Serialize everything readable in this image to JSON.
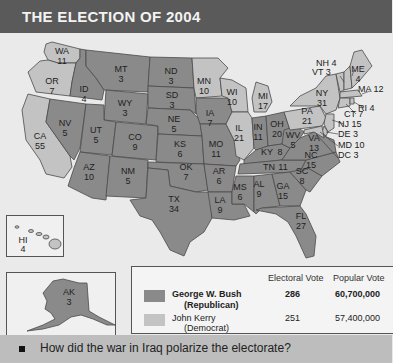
{
  "header": {
    "title": "THE ELECTION OF 2004"
  },
  "colors": {
    "republican": "#8a8a8a",
    "democrat": "#c3c3c3",
    "header_bg": "#5a5a5a",
    "footer_bg": "#bdbdbd"
  },
  "states": {
    "WA": {
      "abbr": "WA",
      "ev": "11",
      "party": "D"
    },
    "OR": {
      "abbr": "OR",
      "ev": "7",
      "party": "D"
    },
    "CA": {
      "abbr": "CA",
      "ev": "55",
      "party": "D"
    },
    "ID": {
      "abbr": "ID",
      "ev": "4",
      "party": "R"
    },
    "NV": {
      "abbr": "NV",
      "ev": "5",
      "party": "R"
    },
    "MT": {
      "abbr": "MT",
      "ev": "3",
      "party": "R"
    },
    "WY": {
      "abbr": "WY",
      "ev": "3",
      "party": "R"
    },
    "UT": {
      "abbr": "UT",
      "ev": "5",
      "party": "R"
    },
    "CO": {
      "abbr": "CO",
      "ev": "9",
      "party": "R"
    },
    "AZ": {
      "abbr": "AZ",
      "ev": "10",
      "party": "R"
    },
    "NM": {
      "abbr": "NM",
      "ev": "5",
      "party": "R"
    },
    "ND": {
      "abbr": "ND",
      "ev": "3",
      "party": "R"
    },
    "SD": {
      "abbr": "SD",
      "ev": "3",
      "party": "R"
    },
    "NE": {
      "abbr": "NE",
      "ev": "5",
      "party": "R"
    },
    "KS": {
      "abbr": "KS",
      "ev": "6",
      "party": "R"
    },
    "OK": {
      "abbr": "OK",
      "ev": "7",
      "party": "R"
    },
    "TX": {
      "abbr": "TX",
      "ev": "34",
      "party": "R"
    },
    "MN": {
      "abbr": "MN",
      "ev": "10",
      "party": "D"
    },
    "IA": {
      "abbr": "IA",
      "ev": "7",
      "party": "R"
    },
    "MO": {
      "abbr": "MO",
      "ev": "11",
      "party": "R"
    },
    "AR": {
      "abbr": "AR",
      "ev": "6",
      "party": "R"
    },
    "LA": {
      "abbr": "LA",
      "ev": "9",
      "party": "R"
    },
    "WI": {
      "abbr": "WI",
      "ev": "10",
      "party": "D"
    },
    "IL": {
      "abbr": "IL",
      "ev": "21",
      "party": "D"
    },
    "MI": {
      "abbr": "MI",
      "ev": "17",
      "party": "D"
    },
    "IN": {
      "abbr": "IN",
      "ev": "11",
      "party": "R"
    },
    "OH": {
      "abbr": "OH",
      "ev": "20",
      "party": "R"
    },
    "KY": {
      "abbr": "KY",
      "ev": "8",
      "party": "R"
    },
    "TN": {
      "abbr": "TN",
      "ev": "11",
      "party": "R"
    },
    "MS": {
      "abbr": "MS",
      "ev": "6",
      "party": "R"
    },
    "AL": {
      "abbr": "AL",
      "ev": "9",
      "party": "R"
    },
    "GA": {
      "abbr": "GA",
      "ev": "15",
      "party": "R"
    },
    "FL": {
      "abbr": "FL",
      "ev": "27",
      "party": "R"
    },
    "SC": {
      "abbr": "SC",
      "ev": "8",
      "party": "R"
    },
    "NC": {
      "abbr": "NC",
      "ev": "15",
      "party": "R"
    },
    "VA": {
      "abbr": "VA",
      "ev": "13",
      "party": "R"
    },
    "WV": {
      "abbr": "WV",
      "ev": "5",
      "party": "R"
    },
    "PA": {
      "abbr": "PA",
      "ev": "21",
      "party": "D"
    },
    "NY": {
      "abbr": "NY",
      "ev": "31",
      "party": "D"
    },
    "NH": {
      "label": "NH 4",
      "party": "D"
    },
    "VT": {
      "label": "VT 3",
      "party": "D"
    },
    "ME": {
      "abbr": "ME",
      "ev": "4",
      "party": "D"
    },
    "MA": {
      "label": "MA 12",
      "party": "D"
    },
    "RI": {
      "label": "RI 4",
      "party": "D"
    },
    "CT": {
      "label": "CT 7",
      "party": "D"
    },
    "NJ": {
      "label": "NJ 15",
      "party": "D"
    },
    "DE": {
      "label": "DE 3",
      "party": "D"
    },
    "MD": {
      "label": "MD 10",
      "party": "D"
    },
    "DC": {
      "label": "DC 3",
      "party": "D"
    },
    "HI": {
      "abbr": "HI",
      "ev": "4",
      "party": "D"
    },
    "AK": {
      "abbr": "AK",
      "ev": "3",
      "party": "R"
    }
  },
  "legend": {
    "col_electoral": "Electoral Vote",
    "col_popular": "Popular Vote",
    "candidates": [
      {
        "name": "George W. Bush",
        "party": "(Republican)",
        "electoral": "286",
        "popular": "60,700,000"
      },
      {
        "name": "John Kerry",
        "party": "(Democrat)",
        "electoral": "251",
        "popular": "57,400,000"
      }
    ]
  },
  "footer": {
    "question": "How did the war in Iraq polarize the electorate?"
  }
}
